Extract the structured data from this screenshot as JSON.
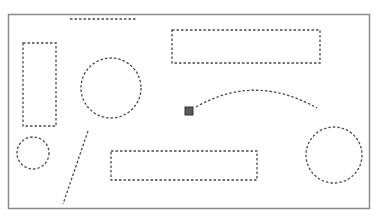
{
  "canvas": {
    "width": 378,
    "height": 217,
    "background": "#ffffff",
    "frame": {
      "x": 8.5,
      "y": 14.5,
      "width": 361,
      "height": 194,
      "stroke": "#8a8a8a",
      "stroke_width": 1.5
    }
  },
  "style": {
    "dash_stroke": "#4a4a4a",
    "dash_width": 1.3,
    "dash_pattern": "2.5 2"
  },
  "shapes": [
    {
      "id": "top-line",
      "type": "line",
      "x1": 70,
      "y1": 19,
      "x2": 136,
      "y2": 19
    },
    {
      "id": "tall-rectangle",
      "type": "rect",
      "x": 23,
      "y": 43,
      "width": 33,
      "height": 83
    },
    {
      "id": "top-wide-rectangle",
      "type": "rect",
      "x": 172,
      "y": 30,
      "width": 148,
      "height": 33
    },
    {
      "id": "large-circle",
      "type": "circle",
      "cx": 111,
      "cy": 88,
      "r": 30
    },
    {
      "id": "arc-curve",
      "type": "path",
      "d": "M 196 107 Q 255 73 317 108"
    },
    {
      "id": "small-circle",
      "type": "circle",
      "cx": 33,
      "cy": 153,
      "r": 16
    },
    {
      "id": "diagonal-line",
      "type": "line",
      "x1": 88,
      "y1": 131,
      "x2": 63,
      "y2": 204
    },
    {
      "id": "bottom-rectangle",
      "type": "rect",
      "x": 111,
      "y": 151,
      "width": 146,
      "height": 29
    },
    {
      "id": "right-circle",
      "type": "circle",
      "cx": 334,
      "cy": 155,
      "r": 28
    }
  ],
  "handle": {
    "id": "selection-handle",
    "x": 185,
    "y": 107,
    "size": 8,
    "fill": "#5a5a5a",
    "stroke": "#333333"
  }
}
